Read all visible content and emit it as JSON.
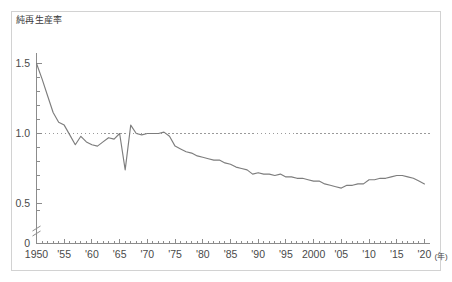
{
  "figure": {
    "axis_title": "純再生産率",
    "x_unit_label": "(年)",
    "line_color": "#7d7d7d",
    "axis_color": "#8c8c8c",
    "frame_color": "#d2d2d2",
    "reference_line_color": "#9a9a9a",
    "background": "#ffffff"
  },
  "chart_data": {
    "type": "line",
    "title": "純再生産率",
    "xlabel": "(年)",
    "ylabel": "純再生産率",
    "xlim": [
      1950,
      2021
    ],
    "ylim": [
      0.4,
      1.55
    ],
    "grid": false,
    "legend": "none",
    "y_ticks": [
      0.5,
      1.0,
      1.5
    ],
    "y_tick_labels": [
      "0.5",
      "1.0",
      "1.5"
    ],
    "y_origin_label": "0",
    "axis_break": true,
    "x_ticks": [
      1950,
      1955,
      1960,
      1965,
      1970,
      1975,
      1980,
      1985,
      1990,
      1995,
      2000,
      2005,
      2010,
      2015,
      2020
    ],
    "x_tick_labels": [
      "1950",
      "'55",
      "'60",
      "'65",
      "'70",
      "'75",
      "'80",
      "'85",
      "'90",
      "'95",
      "2000",
      "'05",
      "'10",
      "'15",
      "'20"
    ],
    "x_minor_tick_interval": 1,
    "reference_lines": [
      {
        "y": 1.0,
        "style": "dotted",
        "label": ""
      }
    ],
    "series": [
      {
        "name": "純再生産率",
        "x": [
          1950,
          1951,
          1952,
          1953,
          1954,
          1955,
          1956,
          1957,
          1958,
          1959,
          1960,
          1961,
          1962,
          1963,
          1964,
          1965,
          1966,
          1967,
          1968,
          1969,
          1970,
          1971,
          1972,
          1973,
          1974,
          1975,
          1976,
          1977,
          1978,
          1979,
          1980,
          1981,
          1982,
          1983,
          1984,
          1985,
          1986,
          1987,
          1988,
          1989,
          1990,
          1991,
          1992,
          1993,
          1994,
          1995,
          1996,
          1997,
          1998,
          1999,
          2000,
          2001,
          2002,
          2003,
          2004,
          2005,
          2006,
          2007,
          2008,
          2009,
          2010,
          2011,
          2012,
          2013,
          2014,
          2015,
          2016,
          2017,
          2018,
          2019,
          2020
        ],
        "values": [
          1.5,
          1.39,
          1.27,
          1.15,
          1.08,
          1.06,
          0.99,
          0.92,
          0.98,
          0.94,
          0.92,
          0.91,
          0.94,
          0.97,
          0.96,
          1.0,
          0.74,
          1.06,
          1.0,
          0.99,
          1.0,
          1.0,
          1.0,
          1.01,
          0.98,
          0.91,
          0.89,
          0.87,
          0.86,
          0.84,
          0.83,
          0.82,
          0.81,
          0.81,
          0.79,
          0.78,
          0.76,
          0.75,
          0.74,
          0.71,
          0.72,
          0.71,
          0.71,
          0.7,
          0.71,
          0.69,
          0.69,
          0.68,
          0.68,
          0.67,
          0.66,
          0.66,
          0.64,
          0.63,
          0.62,
          0.61,
          0.63,
          0.63,
          0.64,
          0.64,
          0.67,
          0.67,
          0.68,
          0.68,
          0.69,
          0.7,
          0.7,
          0.69,
          0.68,
          0.66,
          0.64
        ]
      }
    ]
  }
}
